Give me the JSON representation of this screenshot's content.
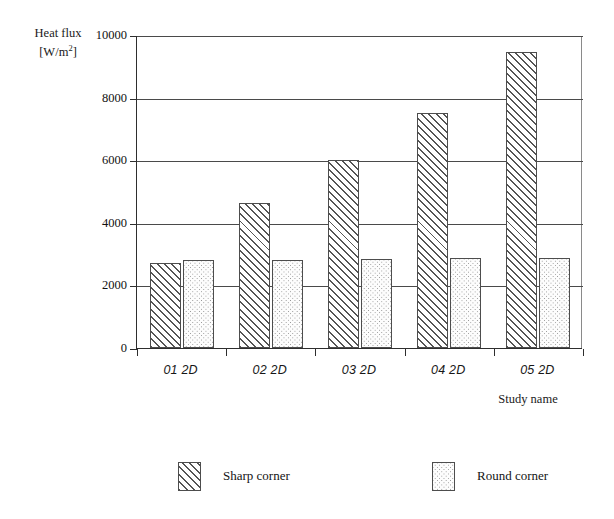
{
  "chart_data": {
    "type": "bar",
    "title": "",
    "categories": [
      "01 2D",
      "02 2D",
      "03 2D",
      "04 2D",
      "05 2D"
    ],
    "series": [
      {
        "name": "Sharp corner",
        "pattern": "diagonal-hatch",
        "values": [
          2720,
          4620,
          6000,
          7500,
          9450
        ]
      },
      {
        "name": "Round corner",
        "pattern": "dotted",
        "values": [
          2800,
          2820,
          2850,
          2860,
          2880
        ]
      }
    ],
    "xlabel": "Study name",
    "ylabel": "Heat flux",
    "ylabel_unit": "[W/m²]",
    "ylabel_unit_prefix": "[W/m",
    "ylabel_unit_sup": "2",
    "ylabel_unit_suffix": "]",
    "ylim": [
      0,
      10000
    ],
    "yticks": [
      0,
      2000,
      4000,
      6000,
      8000,
      10000
    ],
    "ytick_labels": [
      "0",
      "2000",
      "4000",
      "6000",
      "8000",
      "10000"
    ],
    "grid": true,
    "grid_axis": "y",
    "legend_position": "bottom",
    "colors": {
      "axis": "#2e2e2e",
      "gridline": "#4a4a4a",
      "bar_outline": "#4d4d4d",
      "hatch": "#555555",
      "dots": "#8e8e8e",
      "background": "#ffffff",
      "text": "#141414"
    }
  },
  "legend": {
    "items": [
      {
        "label": "Sharp corner",
        "pattern": "diagonal-hatch"
      },
      {
        "label": "Round corner",
        "pattern": "dotted"
      }
    ]
  }
}
